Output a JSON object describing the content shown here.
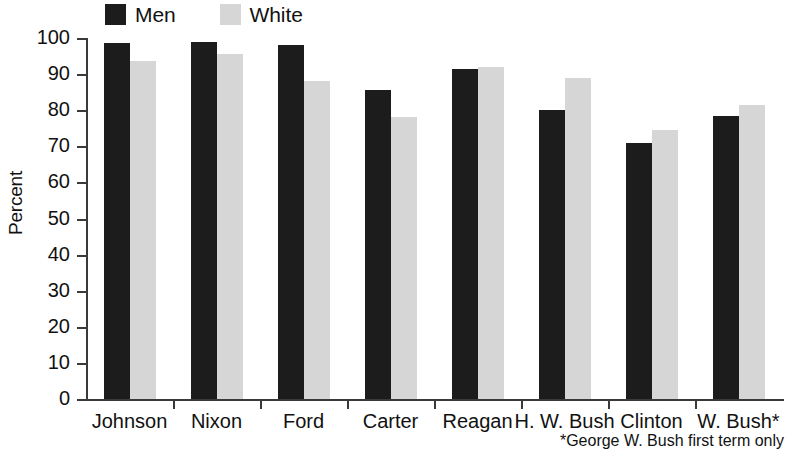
{
  "chart_data": {
    "type": "bar",
    "title": "",
    "xlabel": "",
    "ylabel": "Percent",
    "ylim": [
      0,
      100
    ],
    "ytick_step": 10,
    "yticks": [
      100,
      90,
      80,
      70,
      60,
      50,
      40,
      30,
      20,
      10,
      0
    ],
    "grid": false,
    "legend_position": "top-left",
    "categories": [
      "Johnson",
      "Nixon",
      "Ford",
      "Carter",
      "Reagan",
      "H. W. Bush",
      "Clinton",
      "W. Bush*"
    ],
    "series": [
      {
        "name": "Men",
        "color": "#1c1c1c",
        "values": [
          98.5,
          99,
          98,
          85.5,
          91.5,
          80,
          71,
          78.5
        ]
      },
      {
        "name": "White",
        "color": "#d6d6d6",
        "values": [
          93.5,
          95.5,
          88,
          78,
          92,
          89,
          74.5,
          81.5
        ]
      }
    ],
    "annotations": [
      "*George W. Bush first term only"
    ]
  },
  "legend": {
    "items": [
      {
        "label": "Men",
        "swatch": "dark-square-swatch"
      },
      {
        "label": "White",
        "swatch": "light-square-swatch"
      }
    ]
  },
  "axes": {
    "y_title": "Percent",
    "y_tick_labels": [
      "100",
      "90",
      "80",
      "70",
      "60",
      "50",
      "40",
      "30",
      "20",
      "10",
      "0"
    ],
    "x_tick_labels": [
      "Johnson",
      "Nixon",
      "Ford",
      "Carter",
      "Reagan",
      "H. W. Bush",
      "Clinton",
      "W. Bush*"
    ]
  },
  "footnote": {
    "text": "*George W. Bush first term only"
  }
}
